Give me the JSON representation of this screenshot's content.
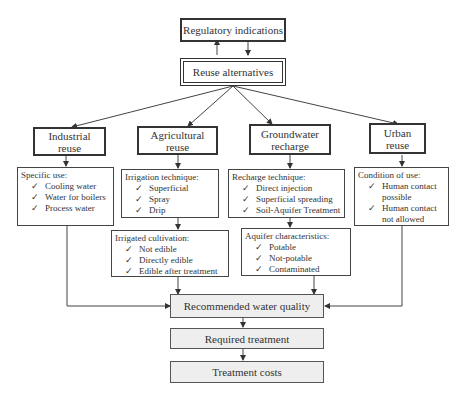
{
  "top": {
    "regulatory": "Regulatory indications",
    "alternatives": "Reuse alternatives"
  },
  "categories": [
    {
      "line1": "Industrial",
      "line2": "reuse"
    },
    {
      "line1": "Agricultural",
      "line2": "reuse"
    },
    {
      "line1": "Groundwater",
      "line2": "recharge"
    },
    {
      "line1": "Urban",
      "line2": "reuse"
    }
  ],
  "details": {
    "industrial": {
      "title": "Specific use:",
      "items": [
        "Cooling water",
        "Water for boilers",
        "Process water"
      ]
    },
    "agricultural": {
      "title": "Irrigation technique:",
      "items": [
        "Superficial",
        "Spray",
        "Drip"
      ]
    },
    "groundwater": {
      "title": "Recharge technique:",
      "items": [
        "Direct injection",
        "Superficial spreading",
        "Soil-Aquifer Treatment"
      ]
    },
    "urban": {
      "title": "Condition of use:",
      "items": [
        "Human contact possible",
        "Human contact not allowed"
      ]
    },
    "cultivation": {
      "title": "Irrigated cultivation:",
      "items": [
        "Not edible",
        "Directly edible",
        "Edible after treatment"
      ]
    },
    "aquifer": {
      "title": "Aquifer characteristics:",
      "items": [
        "Potable",
        "Not-potable",
        "Contaminated"
      ]
    }
  },
  "bottom": {
    "quality": "Recommended water quality",
    "treatment": "Required treatment",
    "costs": "Treatment costs"
  },
  "check_glyph": "✓"
}
